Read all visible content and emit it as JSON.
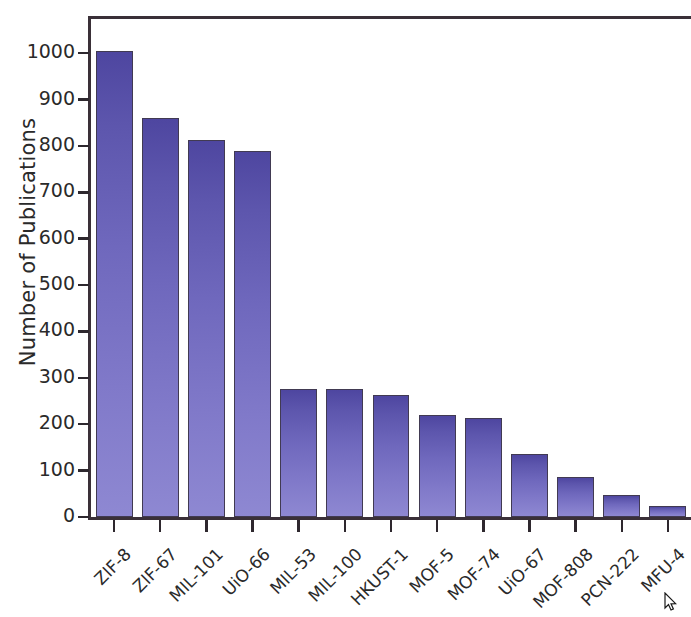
{
  "chart_data": {
    "type": "bar",
    "title": "",
    "xlabel": "",
    "ylabel": "Number of Publications",
    "categories": [
      "ZIF-8",
      "ZIF-67",
      "MIL-101",
      "UiO-66",
      "MIL-53",
      "MIL-100",
      "HKUST-1",
      "MOF-5",
      "MOF-74",
      "UiO-67",
      "MOF-808",
      "PCN-222",
      "MFU-4"
    ],
    "values": [
      1005,
      860,
      812,
      790,
      277,
      276,
      263,
      219,
      214,
      135,
      86,
      47,
      23
    ],
    "ylim": [
      0,
      1080
    ],
    "yticks": [
      0,
      100,
      200,
      300,
      400,
      500,
      600,
      700,
      800,
      900,
      1000
    ],
    "ytick_labels": [
      "0",
      "100",
      "200",
      "300",
      "400",
      "500",
      "600",
      "700",
      "800",
      "900",
      "1000"
    ],
    "grid": false,
    "legend": null,
    "bar_color_top": "#4e46a0",
    "bar_color_bottom": "#8e88d2",
    "bar_edge_color": "#413a52",
    "axis_color": "#3a3038",
    "background": "#ffffff"
  },
  "cursor": {
    "icon": "mouse-pointer-icon",
    "x": 664,
    "y": 592
  }
}
